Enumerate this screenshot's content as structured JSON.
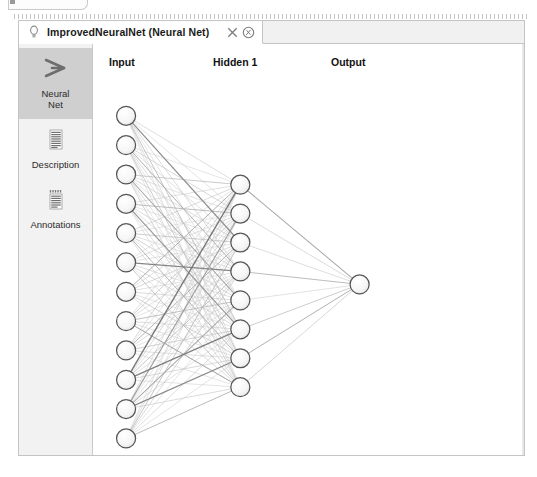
{
  "window": {
    "tab": {
      "title": "ImprovedNeuralNet (Neural Net)",
      "bulb_icon": "lightbulb-icon",
      "close_icon": "close-icon",
      "extra_icon": "pin-circle-icon"
    }
  },
  "sidebar": {
    "items": [
      {
        "label_line1": "Neural",
        "label_line2": "Net",
        "icon": "neural-net-fan-icon",
        "selected": true
      },
      {
        "label_line1": "Description",
        "label_line2": "",
        "icon": "document-lines-icon",
        "selected": false
      },
      {
        "label_line1": "Annotations",
        "label_line2": "",
        "icon": "annotations-icon",
        "selected": false
      }
    ]
  },
  "canvas": {
    "layer_titles": [
      {
        "text": "Input",
        "x": 16,
        "y": 12
      },
      {
        "text": "Hidden 1",
        "x": 120,
        "y": 12
      },
      {
        "text": "Output",
        "x": 238,
        "y": 12
      }
    ],
    "colors": {
      "node_stroke": "#555555",
      "node_fill_top": "#fbfbfb",
      "node_fill_bottom": "#eaeaea",
      "edge_light": "#dcdcdc",
      "edge_dark": "#4a4a4a",
      "canvas_bg": "#ffffff"
    },
    "node_radius": 9.5,
    "layers": [
      {
        "name": "input",
        "count": 12,
        "cx": 33,
        "cy_start": 72,
        "cy_step": 29.4
      },
      {
        "name": "hidden1",
        "count": 8,
        "cx": 147,
        "cy_start": 141,
        "cy_step": 29.0
      },
      {
        "name": "output",
        "count": 1,
        "cx": 266,
        "cy_start": 241,
        "cy_step": 0
      }
    ],
    "edge_weights_input_hidden": [
      [
        0.1,
        0.07,
        0.48,
        0.12,
        0.06,
        0.22,
        0.09,
        0.05
      ],
      [
        0.06,
        0.14,
        0.09,
        0.3,
        0.11,
        0.07,
        0.18,
        0.08
      ],
      [
        0.2,
        0.08,
        0.12,
        0.07,
        0.35,
        0.1,
        0.06,
        0.15
      ],
      [
        0.09,
        0.26,
        0.07,
        0.13,
        0.08,
        0.44,
        0.11,
        0.06
      ],
      [
        0.12,
        0.07,
        0.19,
        0.09,
        0.15,
        0.08,
        0.28,
        0.1
      ],
      [
        0.07,
        0.11,
        0.08,
        0.55,
        0.1,
        0.13,
        0.07,
        0.21
      ],
      [
        0.31,
        0.09,
        0.14,
        0.08,
        0.12,
        0.07,
        0.16,
        0.09
      ],
      [
        0.08,
        0.18,
        0.1,
        0.06,
        0.24,
        0.11,
        0.08,
        0.36
      ],
      [
        0.13,
        0.07,
        0.29,
        0.11,
        0.07,
        0.17,
        0.1,
        0.06
      ],
      [
        0.62,
        0.12,
        0.08,
        0.21,
        0.09,
        0.58,
        0.13,
        0.07
      ],
      [
        0.1,
        0.4,
        0.06,
        0.09,
        0.33,
        0.08,
        0.52,
        0.12
      ],
      [
        0.08,
        0.09,
        0.23,
        0.14,
        0.06,
        0.1,
        0.07,
        0.27
      ]
    ],
    "edge_weights_hidden_output": [
      0.34,
      0.12,
      0.1,
      0.26,
      0.08,
      0.19,
      0.3,
      0.14
    ]
  }
}
